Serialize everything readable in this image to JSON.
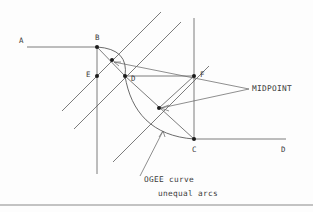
{
  "drawing": {
    "title": "OGEE curve geometric construction",
    "background_color": "#fdfdfd",
    "line_color": "#5a5a5a",
    "dot_color": "#1c1c1c",
    "labels": {
      "point_a": "A",
      "point_b": "B",
      "point_c": "C",
      "point_d": "D",
      "point_e": "E",
      "point_f": "F",
      "midpoint": "MIDPOINT",
      "note_line1": "OGEE curve",
      "note_line2": "unequal arcs"
    },
    "points": [
      {
        "name": "B",
        "x": 97,
        "y": 47
      },
      {
        "name": "E",
        "x": 97,
        "y": 76
      },
      {
        "name": "D",
        "x": 125,
        "y": 76
      },
      {
        "name": "F",
        "x": 194,
        "y": 76
      },
      {
        "name": "C",
        "x": 194,
        "y": 139
      },
      {
        "name": "arc-midpoint-upper",
        "x": 112,
        "y": 60
      },
      {
        "name": "arc-midpoint-lower",
        "x": 159,
        "y": 108
      }
    ]
  }
}
